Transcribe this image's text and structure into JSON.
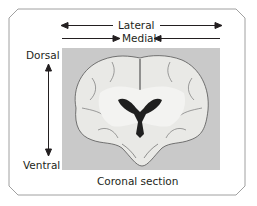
{
  "diagram": {
    "title": "Coronal section",
    "axes": {
      "horizontal": [
        {
          "label": "Lateral",
          "direction": "outward (arrows pointing to both sides)"
        },
        {
          "label": "Medial",
          "direction": "inward (arrows pointing toward center)"
        }
      ],
      "vertical": {
        "top_label": "Dorsal",
        "bottom_label": "Ventral"
      }
    },
    "image": {
      "description": "Coronal section of a brain showing hemispheres, ventricles and gyri",
      "background": "#c9c9c9"
    },
    "colors": {
      "frame": "#9a9a9a",
      "text": "#231f20",
      "arrow": "#231f20"
    }
  }
}
